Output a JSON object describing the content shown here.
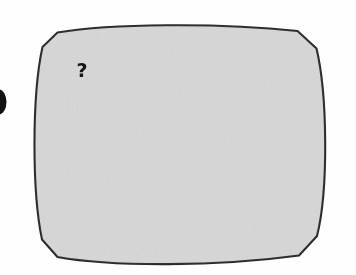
{
  "figure": {
    "name": "rounded-square-screen-outline",
    "background_color": "#ffffff",
    "fill_color": "#d8d8d8",
    "stroke_color": "#2a2a2a",
    "stroke_width": 2,
    "annotation": {
      "text": "?",
      "color": "#141414",
      "x": 82,
      "y": 70
    },
    "edge_mark": {
      "name": "clipped-dot",
      "color": "#111111",
      "x": 0,
      "y": 90,
      "width": 7,
      "height": 25
    },
    "bounds": {
      "left": 33,
      "top": 23,
      "right": 333,
      "bottom": 270
    }
  }
}
